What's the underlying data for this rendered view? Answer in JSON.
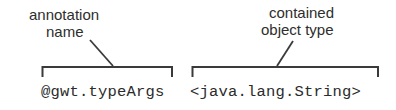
{
  "diagram": {
    "background_color": "#ffffff",
    "stroke_color": "#3a3a3a",
    "text_color": "#2e2e2e",
    "groups": [
      {
        "id": "annotation-name",
        "caption_line_1": "annotation",
        "caption_line_2": "name",
        "code": "@gwt.typeArgs"
      },
      {
        "id": "contained-object-type",
        "caption_line_1": "contained",
        "caption_line_2": "object type",
        "code": "<java.lang.String>"
      }
    ]
  }
}
